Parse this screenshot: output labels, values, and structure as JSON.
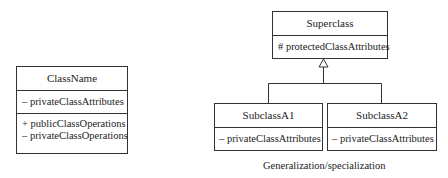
{
  "standalone_class": {
    "name": "ClassName",
    "attributes": [
      "– privateClassAttributes"
    ],
    "operations": [
      "+ publicClassOperations",
      "– privateClassOperations"
    ]
  },
  "superclass": {
    "name": "Superclass",
    "attributes": [
      "# protectedClassAttributes"
    ]
  },
  "subclasses": [
    {
      "name": "SubclassA1",
      "attributes": [
        "– privateClassAttributes"
      ]
    },
    {
      "name": "SubclassA2",
      "attributes": [
        "– privateClassAttributes"
      ]
    }
  ],
  "relationship": "generalization",
  "caption": "Generalization/specialization",
  "colors": {
    "line": "#333333",
    "text": "#222222",
    "background": "#ffffff"
  }
}
